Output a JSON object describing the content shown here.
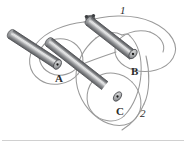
{
  "figure": {
    "background_color": "#ffffff",
    "width": 186,
    "height": 147,
    "rod_body_color": "#8f9092",
    "rod_dark_color": "#56585b",
    "rod_light_color": "#d8d9da",
    "rod_end_face_color": "#a9abad",
    "rod_end_dot_color": "#1a1a1a",
    "wire_color": "#9a9a9a",
    "label_color": "#2b2b2b",
    "baseline_color": "#b9b9b9"
  },
  "rods": [
    {
      "id": "rod-a",
      "label": "A",
      "label_x": 55,
      "label_y": 73,
      "start_x": 10,
      "start_y": 33,
      "end_x": 57,
      "end_y": 64
    },
    {
      "id": "rod-b",
      "label": "B",
      "label_x": 131,
      "label_y": 66,
      "start_x": 88,
      "start_y": 19,
      "end_x": 133,
      "end_y": 54
    },
    {
      "id": "rod-c",
      "label": "C",
      "label_x": 116,
      "label_y": 106,
      "start_x": 48,
      "start_y": 42,
      "end_x": 117,
      "end_y": 97
    }
  ],
  "loops": [
    {
      "id": "loop-1",
      "label": "1",
      "label_x": 120,
      "label_y": 5
    },
    {
      "id": "loop-2",
      "label": "2",
      "label_x": 140,
      "label_y": 108
    }
  ],
  "icons": {
    "current_dot": "current-into-page-dot"
  }
}
